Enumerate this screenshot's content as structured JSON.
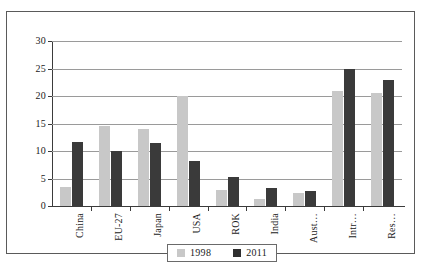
{
  "chart_data": {
    "type": "bar",
    "title": "",
    "subtitle": "",
    "xlabel": "",
    "ylabel": "",
    "ylim": [
      0,
      30
    ],
    "yticks": [
      0,
      5,
      10,
      15,
      20,
      25,
      30
    ],
    "grid": true,
    "legend_position": "bottom-center",
    "categories": [
      "China",
      "EU-27",
      "Japan",
      "USA",
      "ROK",
      "India",
      "Aust…",
      "Intr…",
      "Res…"
    ],
    "series": [
      {
        "name": "1998",
        "color": "#c8c8c8",
        "values": [
          3.5,
          14.5,
          14.0,
          20.0,
          2.9,
          1.2,
          2.3,
          21.0,
          20.5
        ]
      },
      {
        "name": "2011",
        "color": "#3a3a3a",
        "values": [
          11.7,
          10.0,
          11.4,
          8.2,
          5.3,
          3.2,
          2.8,
          25.0,
          23.0
        ]
      }
    ]
  },
  "legend": {
    "items": [
      {
        "label": "1998"
      },
      {
        "label": "2011"
      }
    ]
  }
}
